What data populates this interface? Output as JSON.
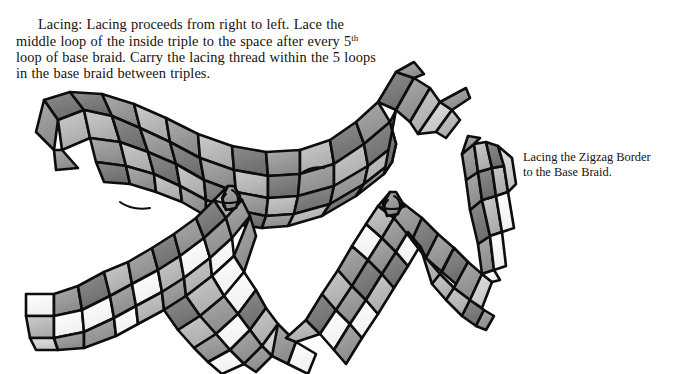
{
  "page": {
    "width": 691,
    "height": 374,
    "background": "#ffffff",
    "ink_color": "#17120e"
  },
  "body_text": {
    "full": "Lacing: Lacing proceeds from right to left. Lace the middle loop of the inside triple to the space after every 5th loop of base braid. Carry the lacing thread within the 5 loops in the base braid between triples.",
    "lead_label": "Lacing:",
    "before_superscript": "Lacing: Lacing proceeds from right to left. Lace the middle loop of the inside triple to the space after every 5",
    "superscript": "th",
    "after_superscript": " loop of base braid. Carry the lacing thread within the 5 loops in the base braid between triples.",
    "lines": [
      "Lacing: Lacing proceeds from right to left. Lace",
      "the middle loop of the inside triple to the space after",
      "every 5th loop of base braid. Carry the lacing thread",
      "within the 5 loops in the base braid between triples."
    ]
  },
  "caption": {
    "line1": "Lacing the Zigzag Border",
    "line2": "to the Base Braid."
  },
  "illustration": {
    "title": "Lacing the zigzag border to the base braid",
    "description": "Grayscale pen-and-ink drawing of three flat plaited braids: a horizontal base braid arching across the top, and two zigzag border braids below that cross and rise, joined to the base braid at two lacing knots.",
    "strand_tones": {
      "dark": "#7a7a7a",
      "mid": "#9a9a9a",
      "light": "#bdbdbd",
      "pale": "#d6d6d6",
      "white": "#ffffff",
      "outline": "#0d0d0d"
    },
    "parts": [
      {
        "name": "base-braid",
        "role": "horizontal base braid arching across the upper area"
      },
      {
        "name": "zigzag-border-left",
        "role": "left zigzag border braid rising to the first lacing knot"
      },
      {
        "name": "zigzag-border-right",
        "role": "right zigzag border braid rising to the second lacing knot"
      },
      {
        "name": "lacing-knot-left",
        "role": "lacing junction where the middle loop of the inside triple meets the base braid"
      },
      {
        "name": "lacing-knot-right",
        "role": "second lacing junction five loops along the base braid"
      },
      {
        "name": "braid-tail-upper-right",
        "role": "free end of the base braid, upper right"
      },
      {
        "name": "braid-tail-right",
        "role": "free end of the right border braid, far right"
      },
      {
        "name": "braid-tail-lower-left",
        "role": "free end of the left border braid, lower left"
      }
    ]
  }
}
